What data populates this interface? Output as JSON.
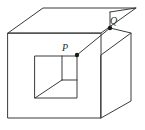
{
  "figure": {
    "kind": "line-drawing",
    "stroke_color": "#3a3a3a",
    "background_color": "#ffffff",
    "stroke_width": 1,
    "vertex_dot_color": "#1a1a1a",
    "vertex_dot_radius": 2,
    "labels": [
      {
        "id": "P",
        "text": "P",
        "x": 62,
        "y": 43
      },
      {
        "id": "Q",
        "text": "Q",
        "x": 110,
        "y": 16
      }
    ],
    "vertex_dots": [
      {
        "id": "P-dot",
        "x": 77,
        "y": 55
      },
      {
        "id": "Q-dot",
        "x": 110,
        "y": 28
      }
    ],
    "paths": {
      "front_face": "M 8 33 L 101 33 L 101 118 L 8 118 Z",
      "top_face": "M 8 33 L 43 8 L 136 8 L 101 33 Z",
      "right_face": "M 101 55 L 131 33 L 131 101 L 101 118 Z",
      "top_right_step": "M 110 12 L 110 28 L 131 33",
      "top_back_right_edge": "M 110 12 L 136 8",
      "p_to_q_edge": "M 77 55 L 110 28",
      "inner_square": "M 35 56 L 77 56 L 77 98 L 35 98 Z",
      "inner_vertical": "M 62 56 L 62 80",
      "inner_horizontal": "M 62 80 L 77 80",
      "inner_diagonal": "M 35 98 L 62 80"
    }
  }
}
